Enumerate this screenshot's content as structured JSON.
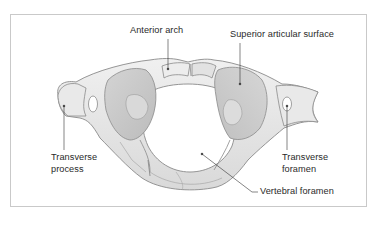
{
  "figure": {
    "colors": {
      "frame_border": "#c9c9c9",
      "bone_fill": "#e6e6e6",
      "bone_light": "#f1f1f1",
      "bone_shade": "#c8c8c8",
      "outline": "#8a8a8a",
      "leader_line": "#333333",
      "label_text": "#2a2a2a"
    }
  },
  "labels": {
    "anterior_arch": "Anterior arch",
    "superior_articular_surface": "Superior articular surface",
    "transverse_process_line1": "Transverse",
    "transverse_process_line2": "process",
    "transverse_foramen_line1": "Transverse",
    "transverse_foramen_line2": "foramen",
    "vertebral_foramen": "Vertebral foramen"
  }
}
